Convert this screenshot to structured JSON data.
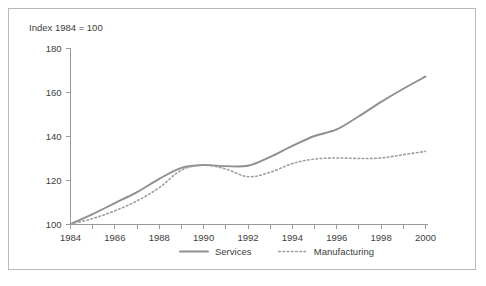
{
  "chart_data": {
    "type": "line",
    "title": "Index 1984 = 100",
    "xlabel": "",
    "ylabel": "",
    "xlim": [
      1984,
      2000
    ],
    "ylim": [
      100,
      180
    ],
    "grid": false,
    "legend_position": "bottom-center",
    "y_ticks": [
      100,
      120,
      140,
      160,
      180
    ],
    "y_tick_labels": [
      "100",
      "120",
      "140",
      "160",
      "180"
    ],
    "x_ticks": [
      1984,
      1985,
      1986,
      1987,
      1988,
      1989,
      1990,
      1991,
      1992,
      1993,
      1994,
      1995,
      1996,
      1997,
      1998,
      1999,
      2000
    ],
    "x_tick_labels": [
      "1984",
      "",
      "1986",
      "",
      "1988",
      "",
      "1990",
      "",
      "1992",
      "",
      "1994",
      "",
      "1996",
      "",
      "1998",
      "",
      "2000"
    ],
    "x_labeled_ticks": [
      "1984",
      "1986",
      "1988",
      "1990",
      "1992",
      "1994",
      "1996",
      "1998",
      "2000"
    ],
    "x": [
      1984,
      1985,
      1986,
      1987,
      1988,
      1989,
      1990,
      1991,
      1992,
      1993,
      1994,
      1995,
      1996,
      1997,
      1998,
      1999,
      2000
    ],
    "series": [
      {
        "name": "Services",
        "style": "solid",
        "color": "#8f8f8f",
        "values": [
          100.0,
          104.5,
          109.5,
          114.5,
          120.5,
          125.5,
          126.8,
          126.3,
          126.5,
          130.5,
          135.5,
          140.0,
          143.0,
          149.0,
          155.5,
          161.5,
          167.0
        ]
      },
      {
        "name": "Manufacturing",
        "style": "dotted",
        "color": "#9d9d9d",
        "values": [
          100.0,
          102.5,
          106.0,
          110.5,
          116.5,
          124.5,
          126.8,
          125.0,
          121.5,
          123.5,
          127.5,
          129.5,
          130.0,
          129.8,
          130.0,
          131.5,
          133.0
        ]
      }
    ]
  },
  "legend": {
    "items": [
      {
        "label": "Services",
        "style": "solid"
      },
      {
        "label": "Manufacturing",
        "style": "dotted"
      }
    ]
  }
}
